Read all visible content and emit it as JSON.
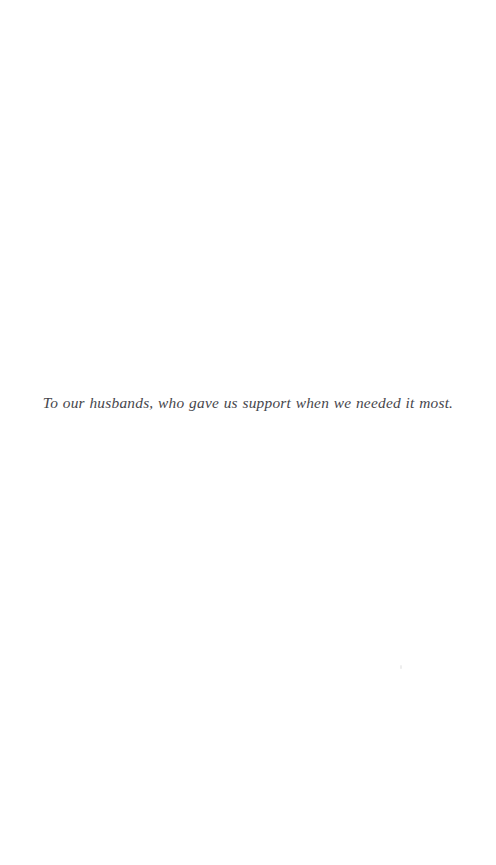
{
  "page": {
    "kind": "book-dedication-page",
    "background_color": "#ffffff",
    "width": 496,
    "height": 865
  },
  "dedication": {
    "text": "To our husbands, who gave us support when we needed it most.",
    "color": "#3a3a3f",
    "alignment": "center"
  },
  "artifacts": {
    "speck_color": "#dedede"
  }
}
